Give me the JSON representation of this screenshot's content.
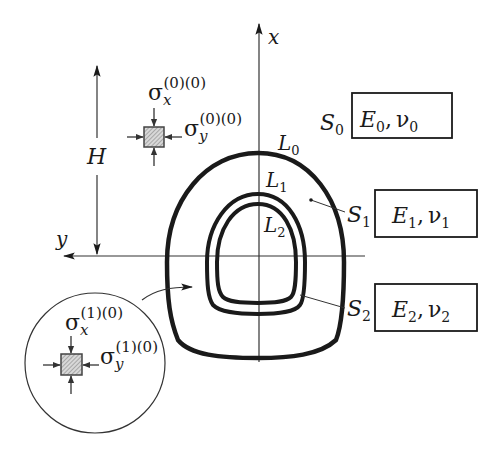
{
  "axes": {
    "x_label": "x",
    "y_label": "y"
  },
  "dimension": {
    "label": "H"
  },
  "contours": [
    {
      "label": "L",
      "sub": "0"
    },
    {
      "label": "L",
      "sub": "1"
    },
    {
      "label": "L",
      "sub": "2"
    }
  ],
  "regions": [
    {
      "label": "S",
      "sub": "0",
      "E": "E",
      "E_sub": "0",
      "nu": "ν",
      "nu_sub": "0"
    },
    {
      "label": "S",
      "sub": "1",
      "E": "E",
      "E_sub": "1",
      "nu": "ν",
      "nu_sub": "1"
    },
    {
      "label": "S",
      "sub": "2",
      "E": "E",
      "E_sub": "2",
      "nu": "ν",
      "nu_sub": "2"
    }
  ],
  "stress_far": {
    "sx_sym": "σ",
    "sx_sub": "x",
    "sx_sup": "(0)(0)",
    "sy_sym": "σ",
    "sy_sub": "y",
    "sy_sup": "(0)(0)"
  },
  "stress_inset": {
    "sx_sym": "σ",
    "sx_sub": "x",
    "sx_sup": "(1)(0)",
    "sy_sym": "σ",
    "sy_sub": "y",
    "sy_sup": "(1)(0)"
  },
  "separator": ","
}
